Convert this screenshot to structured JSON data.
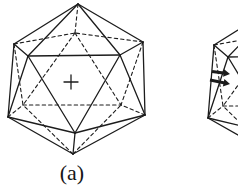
{
  "figure": {
    "background": "#ffffff",
    "line_color": "#1c1c1c",
    "caption_a": "(a)",
    "vertices": {
      "T": [
        78,
        4
      ],
      "UL": [
        14,
        44
      ],
      "UR": [
        143,
        42
      ],
      "LL": [
        8,
        117
      ],
      "LR": [
        145,
        115
      ],
      "B": [
        73,
        154
      ],
      "FL": [
        28,
        56
      ],
      "FR": [
        120,
        55
      ],
      "FB": [
        75,
        133
      ],
      "BT": [
        75,
        33
      ],
      "BL": [
        23,
        105
      ],
      "BR": [
        121,
        105
      ]
    },
    "solid_edges": [
      [
        "T",
        "UL"
      ],
      [
        "UL",
        "LL"
      ],
      [
        "LL",
        "B"
      ],
      [
        "B",
        "LR"
      ],
      [
        "LR",
        "UR"
      ],
      [
        "UR",
        "T"
      ],
      [
        "T",
        "FL"
      ],
      [
        "T",
        "FR"
      ],
      [
        "UL",
        "FL"
      ],
      [
        "UR",
        "FR"
      ],
      [
        "LL",
        "FL"
      ],
      [
        "LR",
        "FR"
      ],
      [
        "LL",
        "FB"
      ],
      [
        "LR",
        "FB"
      ],
      [
        "B",
        "FB"
      ],
      [
        "FL",
        "FR"
      ],
      [
        "FL",
        "FB"
      ],
      [
        "FR",
        "FB"
      ]
    ],
    "dashed_edges": [
      [
        "T",
        "BT"
      ],
      [
        "UL",
        "BT"
      ],
      [
        "UR",
        "BT"
      ],
      [
        "BT",
        "BL"
      ],
      [
        "BT",
        "BR"
      ],
      [
        "UL",
        "BL"
      ],
      [
        "UR",
        "BR"
      ],
      [
        "LL",
        "BL"
      ],
      [
        "LR",
        "BR"
      ],
      [
        "B",
        "BL"
      ],
      [
        "B",
        "BR"
      ],
      [
        "BL",
        "BR"
      ]
    ],
    "instances": [
      {
        "name": "icosahedron-a",
        "dx": 0,
        "dy": 0
      },
      {
        "name": "icosahedron-b-partial",
        "dx": 200,
        "dy": 1
      }
    ],
    "plus_marker": {
      "symbol": "+",
      "x": 71,
      "y": 82,
      "half_arm": 7
    },
    "arrows": [
      {
        "x1": 212,
        "y1": 71.5,
        "x2": 230,
        "y2": 74
      },
      {
        "x1": 210,
        "y1": 80,
        "x2": 230,
        "y2": 84
      }
    ]
  }
}
